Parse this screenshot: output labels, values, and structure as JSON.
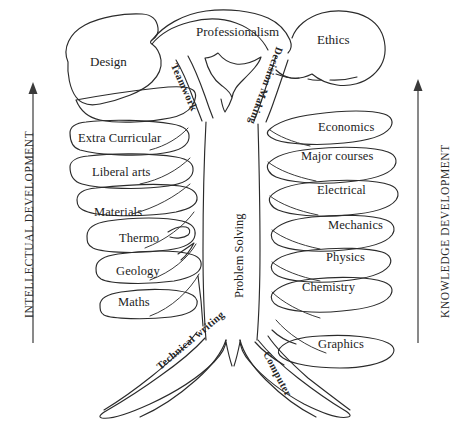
{
  "figure": {
    "type": "tree-diagram",
    "title_visible": false,
    "background_color": "#ffffff",
    "ink_color": "#2b2b2b"
  },
  "axes": {
    "left": {
      "label": "INTELLECTUAL DEVELOPMENT",
      "direction": "upward",
      "arrowhead": "up"
    },
    "right": {
      "label": "KNOWLEDGE DEVELOPMENT",
      "direction": "upward",
      "arrowhead": "up"
    }
  },
  "canopy": {
    "items": [
      {
        "label": "Design"
      },
      {
        "label": "Professionalism"
      },
      {
        "label": "Ethics"
      }
    ]
  },
  "stems": {
    "items": [
      {
        "label": "Teamwork"
      },
      {
        "label": "Decision Making"
      }
    ]
  },
  "trunk": {
    "label": "Problem Solving"
  },
  "branches": {
    "left_heading": "INTELLECTUAL DEVELOPMENT",
    "right_heading": "KNOWLEDGE DEVELOPMENT",
    "left": [
      {
        "label": "Extra Curricular"
      },
      {
        "label": "Liberal arts"
      },
      {
        "label": "Materials"
      },
      {
        "label": "Thermo"
      },
      {
        "label": "Geology"
      },
      {
        "label": "Maths"
      }
    ],
    "right": [
      {
        "label": "Economics"
      },
      {
        "label": "Major courses"
      },
      {
        "label": "Electrical"
      },
      {
        "label": "Mechanics"
      },
      {
        "label": "Physics"
      },
      {
        "label": "Chemistry"
      },
      {
        "label": "Graphics"
      }
    ]
  },
  "roots": {
    "items": [
      {
        "label": "Technical writing"
      },
      {
        "label": "Computer"
      }
    ]
  }
}
